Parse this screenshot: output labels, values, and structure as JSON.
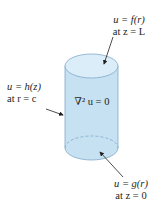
{
  "diagram": {
    "type": "cylinder-boundary-value-problem",
    "fill_color": "#c6e1f2",
    "top_fill_color": "#d9ecf8",
    "stroke_color": "#6e9cbf",
    "arrow_color": "#231f20"
  },
  "labels": {
    "top": {
      "line1": "u = f(r)",
      "line2": "at z = L"
    },
    "side": {
      "line1": "u = h(z)",
      "line2": "at r = c"
    },
    "interior": {
      "equation": "∇² u = 0"
    },
    "bottom": {
      "line1": "u = g(r)",
      "line2": "at z = 0"
    }
  }
}
